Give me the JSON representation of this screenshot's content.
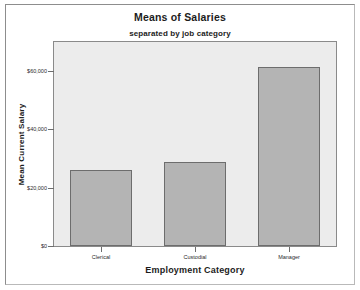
{
  "document": {
    "background_color": "#ffffff",
    "border_color": "#8d8d8d"
  },
  "chart_data": {
    "type": "bar",
    "title": "Means of Salaries",
    "subtitle": "separated by job category",
    "xlabel": "Employment Category",
    "ylabel": "Mean Current Salary",
    "categories": [
      "Clerical",
      "Custodial",
      "Manager"
    ],
    "values": [
      26200,
      29000,
      61400
    ],
    "ylim": [
      0,
      70000
    ],
    "ytick_values": [
      0,
      20000,
      40000,
      60000
    ],
    "ytick_labels": [
      "$0",
      "$20,000",
      "$40,000",
      "$60,000"
    ],
    "grid": false,
    "legend": null,
    "bar_fill_color": "#b4b4b4",
    "bar_border_color": "#6d6d6d",
    "plot_background_color": "#ececec",
    "plot_border_color": "#8a8a8a"
  }
}
